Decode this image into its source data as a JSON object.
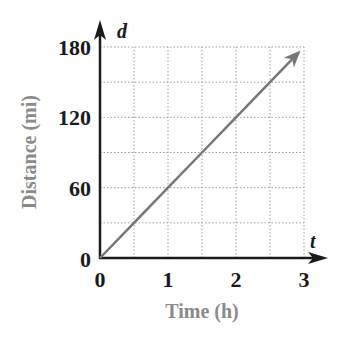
{
  "chart_data": {
    "type": "line",
    "title": "",
    "xlabel": "Time (h)",
    "ylabel": "Distance (mi)",
    "x_axis_variable": "t",
    "y_axis_variable": "d",
    "xlim": [
      0,
      3
    ],
    "ylim": [
      0,
      180
    ],
    "x_ticks": [
      0,
      1,
      2,
      3
    ],
    "x_tick_labels": [
      "0",
      "1",
      "2",
      "3"
    ],
    "y_ticks": [
      0,
      60,
      120,
      180
    ],
    "y_tick_labels": [
      "0",
      "60",
      "120",
      "180"
    ],
    "grid": true,
    "grid_style": "dotted",
    "x_grid_step": 0.5,
    "y_grid_step": 30,
    "legend": null,
    "series": [
      {
        "name": "distance",
        "x": [
          0,
          0.5,
          1,
          1.5,
          2,
          2.5,
          2.95
        ],
        "values": [
          0,
          30,
          60,
          90,
          120,
          150,
          177
        ],
        "arrow_end": true
      }
    ],
    "slope_mi_per_h": 60
  },
  "colors": {
    "axis": "#1a1a1a",
    "line": "#777777",
    "grid": "#9a9a9a",
    "axis_title": "#8a8a8a",
    "tick_label": "#1a1a1a"
  }
}
